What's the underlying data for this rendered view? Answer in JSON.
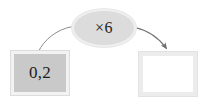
{
  "diagram": {
    "type": "function-machine",
    "title": "",
    "input": {
      "label": "0,2",
      "value": 0.2,
      "fill_color": "#c9c9c9",
      "border_color": "#f2f2f2"
    },
    "operation": {
      "label": "×6",
      "operator": "×",
      "operand": 6,
      "fill_color": "#dcdcdc",
      "border_color": "#efefef"
    },
    "output": {
      "label": "",
      "value": "",
      "fill_color": "#ffffff",
      "border_color": "#ececec"
    },
    "arrows": {
      "in_arrow": {
        "name": "input-to-operation",
        "has_head": false,
        "color": "#8c8c8c"
      },
      "out_arrow": {
        "name": "operation-to-output",
        "has_head": true,
        "color": "#6e6e6e"
      }
    },
    "background_color": "#ffffff"
  }
}
